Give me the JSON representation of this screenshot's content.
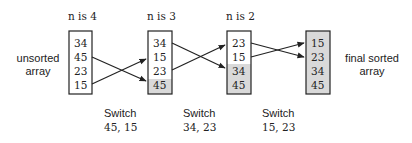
{
  "diagram": {
    "title_labels": [
      "n is 4",
      "n is 3",
      "n is 2"
    ],
    "left_label": [
      "unsorted",
      "array"
    ],
    "right_label": [
      "final sorted",
      "array"
    ],
    "arrays": [
      {
        "values": [
          "34",
          "45",
          "23",
          "15"
        ],
        "sorted_from": 4
      },
      {
        "values": [
          "34",
          "15",
          "23",
          "45"
        ],
        "sorted_from": 3
      },
      {
        "values": [
          "23",
          "15",
          "34",
          "45"
        ],
        "sorted_from": 2
      },
      {
        "values": [
          "15",
          "23",
          "34",
          "45"
        ],
        "sorted_from": 0
      }
    ],
    "switch_labels": [
      {
        "line1": "Switch",
        "line2": "45, 15"
      },
      {
        "line1": "Switch",
        "line2": "34, 23"
      },
      {
        "line1": "Switch",
        "line2": "15, 23"
      }
    ],
    "colors": {
      "shaded": "#d9d9d9",
      "stroke": "#222222"
    }
  }
}
